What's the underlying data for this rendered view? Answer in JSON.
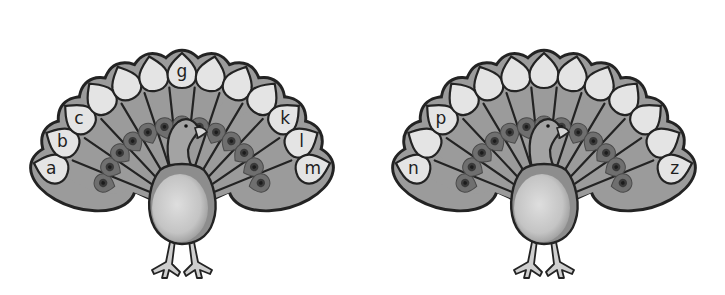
{
  "worksheet": {
    "title": "Peacock alphabet feathers",
    "colors": {
      "background": "#ffffff",
      "outline": "#232323",
      "tail": "#9b9b9b",
      "tail_shadow": "#8f8f8f",
      "feather_spot": "#e4e4e4",
      "eye_outer": "#6f6f6f",
      "eye_inner": "#3a3a3a",
      "body_light": "#dedede",
      "body_dark": "#9a9a9a",
      "neck": "#a3a3a3",
      "beak": "#d6d6d6",
      "legs": "#cfcfcf"
    }
  },
  "peacocks": [
    {
      "name": "left-peacock",
      "offset_x": 0,
      "feathers": [
        {
          "letter": "a",
          "hidden": false
        },
        {
          "letter": "b",
          "hidden": false
        },
        {
          "letter": "c",
          "hidden": false
        },
        {
          "letter": "d",
          "hidden": true
        },
        {
          "letter": "e",
          "hidden": true
        },
        {
          "letter": "f",
          "hidden": true
        },
        {
          "letter": "g",
          "hidden": false
        },
        {
          "letter": "h",
          "hidden": true
        },
        {
          "letter": "i",
          "hidden": true
        },
        {
          "letter": "j",
          "hidden": true
        },
        {
          "letter": "k",
          "hidden": false
        },
        {
          "letter": "l",
          "hidden": false
        },
        {
          "letter": "m",
          "hidden": false
        }
      ]
    },
    {
      "name": "right-peacock",
      "offset_x": 362,
      "feathers": [
        {
          "letter": "n",
          "hidden": false
        },
        {
          "letter": "o",
          "hidden": true
        },
        {
          "letter": "p",
          "hidden": false
        },
        {
          "letter": "q",
          "hidden": true
        },
        {
          "letter": "r",
          "hidden": true
        },
        {
          "letter": "s",
          "hidden": true
        },
        {
          "letter": "t",
          "hidden": true
        },
        {
          "letter": "u",
          "hidden": true
        },
        {
          "letter": "v",
          "hidden": true
        },
        {
          "letter": "w",
          "hidden": true
        },
        {
          "letter": "x",
          "hidden": true
        },
        {
          "letter": "y",
          "hidden": true
        },
        {
          "letter": "z",
          "hidden": false
        }
      ]
    }
  ]
}
